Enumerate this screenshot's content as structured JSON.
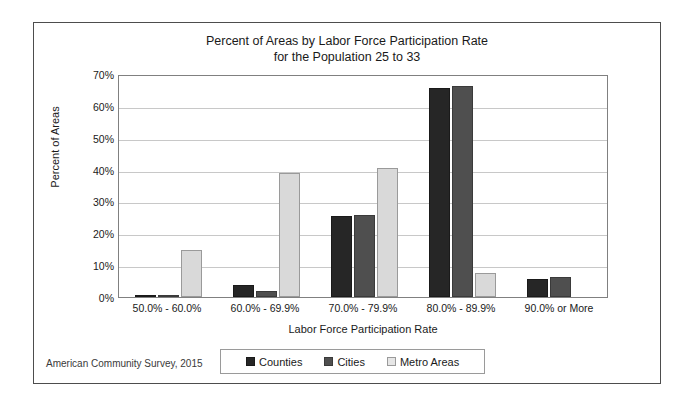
{
  "figure": {
    "title_line1": "Percent of Areas by Labor Force Participation Rate",
    "title_line2": "for the Population 25 to 33",
    "source_note": "American Community Survey, 2015",
    "border_color": "#4d4d4d"
  },
  "legend": {
    "position": "bottom",
    "entries": [
      {
        "label": "Counties",
        "color": "#262626"
      },
      {
        "label": "Cities",
        "color": "#4f4f4f"
      },
      {
        "label": "Metro Areas",
        "color": "#d9d9d9"
      }
    ]
  },
  "chart_data": {
    "type": "bar",
    "title": "Percent of Areas by Labor Force Participation Rate for the Population 25 to 33",
    "xlabel": "Labor Force Participation Rate",
    "ylabel": "Percent of Areas",
    "categories": [
      "50.0% - 60.0%",
      "60.0% - 69.9%",
      "70.0% - 79.9%",
      "80.0% - 89.9%",
      "90.0% or More"
    ],
    "series": [
      {
        "name": "Counties",
        "color": "#262626",
        "values": [
          0.5,
          3.8,
          25.3,
          65.6,
          5.8
        ]
      },
      {
        "name": "Cities",
        "color": "#4f4f4f",
        "values": [
          0.4,
          2.0,
          25.7,
          66.2,
          6.3
        ]
      },
      {
        "name": "Metro Areas",
        "color": "#d9d9d9",
        "values": [
          14.7,
          38.8,
          40.6,
          7.5,
          0.0
        ]
      }
    ],
    "ylim": [
      0,
      70
    ],
    "yticks": [
      0,
      10,
      20,
      30,
      40,
      50,
      60,
      70
    ],
    "ytick_labels": [
      "0%",
      "10%",
      "20%",
      "30%",
      "40%",
      "50%",
      "60%",
      "70%"
    ],
    "grid": "horizontal",
    "legend_position": "bottom"
  }
}
